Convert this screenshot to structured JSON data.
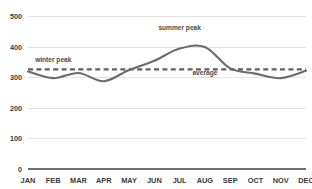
{
  "chart_data": {
    "type": "line",
    "title": "",
    "subtitle": "",
    "xlabel": "",
    "ylabel": "",
    "categories": [
      "JAN",
      "FEB",
      "MAR",
      "APR",
      "MAY",
      "JUN",
      "JUL",
      "AUG",
      "SEP",
      "OCT",
      "NOV",
      "DEC"
    ],
    "series": [
      {
        "name": "monthly value",
        "values": [
          320,
          298,
          315,
          288,
          325,
          355,
          395,
          400,
          330,
          313,
          298,
          322
        ]
      },
      {
        "name": "average",
        "type": "reference-line",
        "value": 327,
        "style": "dashed"
      }
    ],
    "ylim": [
      0,
      520
    ],
    "yticks": [
      0,
      100,
      200,
      300,
      400,
      500
    ],
    "ytick_labels": [
      "0",
      "100",
      "200",
      "300",
      "400",
      "500"
    ],
    "xtick_labels": [
      "JAN",
      "FEB",
      "MAR",
      "APR",
      "MAY",
      "JUN",
      "JUL",
      "AUG",
      "SEP",
      "OCT",
      "NOV",
      "DEC"
    ],
    "grid": true,
    "grid_axis": "y",
    "legend": false,
    "legend_position": "none",
    "annotations": [
      {
        "id": "winter-peak",
        "text": "winter peak",
        "x_category": "FEB",
        "y_value": 352
      },
      {
        "id": "summer-peak",
        "text": "summer peak",
        "x_category": "JUL",
        "y_value": 455
      },
      {
        "id": "average",
        "text": "average",
        "x_category": "AUG",
        "y_value": 308
      }
    ],
    "colors": {
      "series_line": "#6b6b6b",
      "average_line": "#5f5f5f",
      "gridline": "#e3e3e3",
      "axis": "#6e6e6e",
      "tick_label": "#3a3a3a",
      "annotation_label": "#4a4a4a",
      "background": "#ffffff"
    }
  }
}
